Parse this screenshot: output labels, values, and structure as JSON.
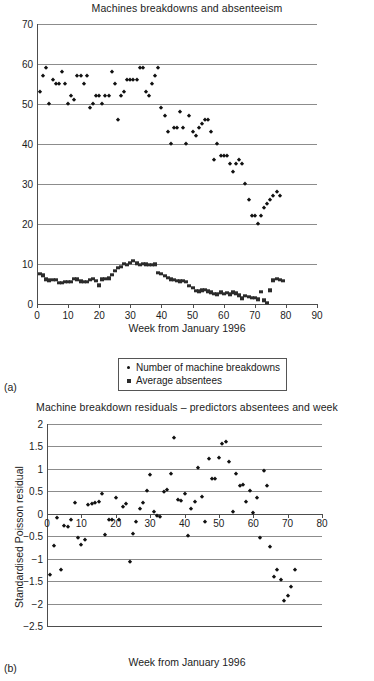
{
  "panels": {
    "a_label": "(a)",
    "b_label": "(b)"
  },
  "legend": {
    "items": [
      {
        "label": "Number of machine breakdowns",
        "marker": "diamond-marker-icon"
      },
      {
        "label": "Average absentees",
        "marker": "square-marker-icon"
      }
    ]
  },
  "chart_data": [
    {
      "type": "scatter",
      "title": "Machines breakdowns and absenteeism",
      "xlabel": "Week from January 1996",
      "ylabel": "",
      "xlim": [
        0,
        90
      ],
      "ylim": [
        0,
        70
      ],
      "xticks": [
        0,
        10,
        20,
        30,
        40,
        50,
        60,
        70,
        80,
        90
      ],
      "yticks": [
        0,
        10,
        20,
        30,
        40,
        50,
        60,
        70
      ],
      "grid": "horizontal",
      "legend_position": "below-axis",
      "series": [
        {
          "name": "Number of machine breakdowns",
          "marker": "diamond",
          "x": [
            1,
            2,
            3,
            4,
            5,
            6,
            7,
            8,
            9,
            10,
            11,
            12,
            13,
            14,
            15,
            16,
            17,
            18,
            19,
            20,
            21,
            22,
            23,
            24,
            25,
            26,
            27,
            28,
            29,
            30,
            31,
            32,
            33,
            34,
            35,
            36,
            37,
            38,
            39,
            40,
            41,
            42,
            43,
            44,
            45,
            46,
            47,
            48,
            49,
            50,
            51,
            52,
            53,
            54,
            55,
            56,
            57,
            58,
            59,
            60,
            61,
            62,
            63,
            64,
            65,
            66,
            67,
            68,
            69,
            70,
            71,
            72,
            73,
            74,
            75,
            76,
            77,
            78,
            79
          ],
          "y": [
            53,
            57,
            59,
            50,
            56,
            55,
            55,
            58,
            55,
            50,
            52,
            51,
            57,
            57,
            55,
            57,
            49,
            50,
            52,
            52,
            50,
            52,
            52,
            58,
            55,
            46,
            52,
            53,
            56,
            56,
            56,
            56,
            59,
            59,
            53,
            52,
            55,
            57,
            59,
            49,
            47,
            43,
            40,
            44,
            44,
            48,
            44,
            40,
            47,
            43,
            42,
            44,
            45,
            46,
            46,
            43,
            36,
            40,
            37,
            37,
            37,
            35,
            33,
            35,
            36,
            35,
            30,
            26,
            22,
            22,
            20,
            22,
            24,
            25,
            26,
            27,
            28,
            27,
            null
          ],
          "n_points": 78
        },
        {
          "name": "Average absentees",
          "marker": "square",
          "x": [
            1,
            2,
            3,
            4,
            5,
            6,
            7,
            8,
            9,
            10,
            11,
            12,
            13,
            14,
            15,
            16,
            17,
            18,
            19,
            20,
            21,
            22,
            23,
            24,
            25,
            26,
            27,
            28,
            29,
            30,
            31,
            32,
            33,
            34,
            35,
            36,
            37,
            38,
            39,
            40,
            41,
            42,
            43,
            44,
            45,
            46,
            47,
            48,
            49,
            50,
            51,
            52,
            53,
            54,
            55,
            56,
            57,
            58,
            59,
            60,
            61,
            62,
            63,
            64,
            65,
            66,
            67,
            68,
            69,
            70,
            71,
            72,
            73,
            74,
            75,
            76,
            77,
            78,
            79
          ],
          "y": [
            7.6,
            7.2,
            6.2,
            5.9,
            6.1,
            6.0,
            5.3,
            5.3,
            5.5,
            5.6,
            5.6,
            6.3,
            6.2,
            5.7,
            5.6,
            5.6,
            6.0,
            6.3,
            5.8,
            4.7,
            6.2,
            6.3,
            6.4,
            7.3,
            8.3,
            9.0,
            9.3,
            10.0,
            9.8,
            10.3,
            10.8,
            10.2,
            9.8,
            10.0,
            9.9,
            9.8,
            9.8,
            9.9,
            7.8,
            7.5,
            7.0,
            6.6,
            6.2,
            6.0,
            5.8,
            5.7,
            5.8,
            5.5,
            4.5,
            4.0,
            3.3,
            3.2,
            3.4,
            3.6,
            3.2,
            2.9,
            2.6,
            2.4,
            2.9,
            2.5,
            2.8,
            2.4,
            2.9,
            2.7,
            2.2,
            1.4,
            2.1,
            1.8,
            1.5,
            1.5,
            1.2,
            3.0,
            0.9,
            0.3,
            3.4,
            5.9,
            6.3,
            6.0,
            5.8
          ],
          "n_points": 79
        }
      ]
    },
    {
      "type": "scatter",
      "title": "Machine breakdown residuals – predictors absentees and week",
      "xlabel": "Week from January 1996",
      "ylabel": "Standardised Poisson residual",
      "xlim": [
        0,
        80
      ],
      "ylim": [
        -2.5,
        2
      ],
      "xticks": [
        0,
        10,
        20,
        30,
        40,
        50,
        60,
        70,
        80
      ],
      "yticks": [
        -2.5,
        -2,
        -1.5,
        -1,
        -0.5,
        0,
        0.5,
        1,
        1.5,
        2
      ],
      "grid": "horizontal",
      "legend_position": "none",
      "series": [
        {
          "name": "Standardised Poisson residual",
          "marker": "diamond",
          "x": [
            1,
            2,
            3,
            4,
            5,
            6,
            7,
            8,
            9,
            10,
            11,
            12,
            13,
            14,
            15,
            16,
            17,
            18,
            19,
            20,
            21,
            22,
            23,
            24,
            25,
            26,
            27,
            28,
            29,
            30,
            31,
            32,
            33,
            34,
            35,
            36,
            37,
            38,
            39,
            40,
            41,
            42,
            43,
            44,
            45,
            46,
            47,
            48,
            49,
            50,
            51,
            52,
            53,
            54,
            55,
            56,
            57,
            58,
            59,
            60,
            61,
            62,
            63,
            64,
            65,
            66,
            67,
            68,
            69,
            70,
            71,
            72
          ],
          "y": [
            -1.37,
            -0.72,
            -0.1,
            -1.25,
            -0.27,
            -0.3,
            -0.13,
            0.25,
            -0.55,
            -0.7,
            -0.58,
            0.19,
            0.21,
            0.23,
            0.27,
            0.45,
            -0.47,
            -0.13,
            -0.14,
            0.35,
            -0.13,
            0.14,
            0.21,
            -1.08,
            -0.45,
            -0.18,
            0.11,
            0.25,
            0.5,
            0.86,
            0.03,
            -0.06,
            -0.08,
            0.49,
            0.53,
            0.88,
            1.69,
            0.31,
            0.29,
            0.43,
            -0.5,
            0.1,
            0.26,
            1.02,
            0.37,
            -0.18,
            1.22,
            0.77,
            0.78,
            1.25,
            1.56,
            1.6,
            1.15,
            0.03,
            0.89,
            0.61,
            0.64,
            0.26,
            0.5,
            0.01,
            0.36,
            -0.53,
            0.96,
            0.62,
            -0.73,
            -1.41,
            -1.26,
            -1.48,
            -1.94,
            -1.84,
            -1.63,
            -1.25
          ],
          "n_points": 72
        }
      ]
    }
  ]
}
